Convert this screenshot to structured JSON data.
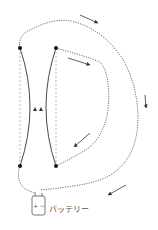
{
  "diagram": {
    "battery": {
      "label": "バッテリー",
      "terminals": "+ −"
    },
    "colors": {
      "line": "#333333",
      "dashed": "#999999",
      "background": "#ffffff"
    },
    "arrows": [
      {
        "location": "outer-top",
        "direction": "down-right"
      },
      {
        "location": "inner-top",
        "direction": "right"
      },
      {
        "location": "outer-right",
        "direction": "down"
      },
      {
        "location": "inner-bottom",
        "direction": "down-left"
      },
      {
        "location": "outer-bottom",
        "direction": "down-left"
      }
    ],
    "wire_arrows": [
      {
        "location": "left-wire-middle",
        "direction": "up"
      },
      {
        "location": "right-wire-middle",
        "direction": "up"
      }
    ]
  }
}
